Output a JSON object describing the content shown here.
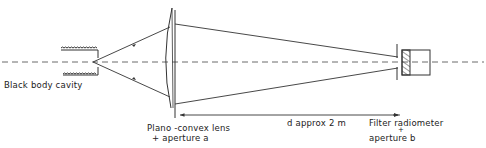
{
  "diagram": {
    "title": "",
    "components": {
      "source": {
        "label": "Black body cavity"
      },
      "lens": {
        "label_line1": "Plano -convex lens",
        "label_line2": "+ aperture a"
      },
      "distance": {
        "label": "d approx  2 m"
      },
      "detector": {
        "label_line1": "Filter radiometer",
        "label_line2_plus": "+",
        "label_line2": "aperture b"
      }
    },
    "colors": {
      "line": "#333333",
      "background": "#ffffff"
    }
  }
}
